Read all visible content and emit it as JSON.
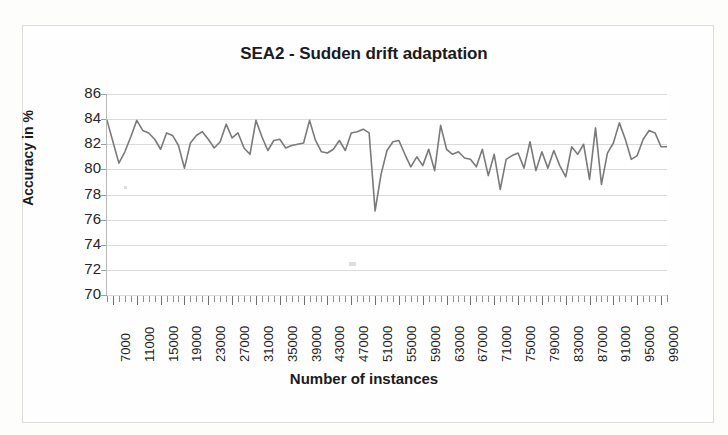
{
  "figure": {
    "title": "SEA2 - Sudden drift adaptation",
    "x_axis_title": "Number of instances",
    "y_axis_title": "Accuracy in %",
    "line_color": "#7a7a7a",
    "gridline_color": "#dadada",
    "background_color": "#fefefe"
  },
  "chart_data": {
    "type": "line",
    "title": "SEA2 - Sudden drift adaptation",
    "xlabel": "Number of instances",
    "ylabel": "Accuracy in %",
    "xlim": [
      6000,
      100000
    ],
    "ylim": [
      70,
      86
    ],
    "yticks": [
      70,
      72,
      74,
      76,
      78,
      80,
      82,
      84,
      86
    ],
    "xticks": [
      7000,
      11000,
      15000,
      19000,
      23000,
      27000,
      31000,
      35000,
      39000,
      43000,
      47000,
      51000,
      55000,
      59000,
      63000,
      67000,
      71000,
      75000,
      79000,
      83000,
      87000,
      91000,
      95000,
      99000
    ],
    "xtick_labels": [
      "7000",
      "11000",
      "15000",
      "19000",
      "23000",
      "27000",
      "31000",
      "35000",
      "39000",
      "43000",
      "47000",
      "51000",
      "55000",
      "59000",
      "63000",
      "67000",
      "71000",
      "75000",
      "79000",
      "83000",
      "87000",
      "91000",
      "95000",
      "99000"
    ],
    "grid": "horizontal",
    "legend": "none",
    "x_step": 1000,
    "series": [
      {
        "name": "Accuracy",
        "x": [
          6000,
          7000,
          8000,
          9000,
          10000,
          11000,
          12000,
          13000,
          14000,
          15000,
          16000,
          17000,
          18000,
          19000,
          20000,
          21000,
          22000,
          23000,
          24000,
          25000,
          26000,
          27000,
          28000,
          29000,
          30000,
          31000,
          32000,
          33000,
          34000,
          35000,
          36000,
          37000,
          38000,
          39000,
          40000,
          41000,
          42000,
          43000,
          44000,
          45000,
          46000,
          47000,
          48000,
          49000,
          50000,
          51000,
          52000,
          53000,
          54000,
          55000,
          56000,
          57000,
          58000,
          59000,
          60000,
          61000,
          62000,
          63000,
          64000,
          65000,
          66000,
          67000,
          68000,
          69000,
          70000,
          71000,
          72000,
          73000,
          74000,
          75000,
          76000,
          77000,
          78000,
          79000,
          80000,
          81000,
          82000,
          83000,
          84000,
          85000,
          86000,
          87000,
          88000,
          89000,
          90000,
          91000,
          92000,
          93000,
          94000,
          95000,
          96000,
          97000,
          98000,
          99000,
          100000
        ],
        "y": [
          83.9,
          82.2,
          80.5,
          81.4,
          82.6,
          83.9,
          83.1,
          82.9,
          82.4,
          81.6,
          82.9,
          82.7,
          81.9,
          80.1,
          82.1,
          82.7,
          83.0,
          82.4,
          81.7,
          82.2,
          83.6,
          82.5,
          82.9,
          81.7,
          81.2,
          83.9,
          82.6,
          81.5,
          82.3,
          82.4,
          81.7,
          81.9,
          82.0,
          82.1,
          83.9,
          82.3,
          81.4,
          81.3,
          81.6,
          82.3,
          81.5,
          82.9,
          83.0,
          83.2,
          82.9,
          76.7,
          79.6,
          81.5,
          82.2,
          82.3,
          81.2,
          80.2,
          81.0,
          80.3,
          81.6,
          79.9,
          83.5,
          81.6,
          81.2,
          81.4,
          80.9,
          80.8,
          80.2,
          81.6,
          79.5,
          81.2,
          78.4,
          80.8,
          81.1,
          81.3,
          80.1,
          82.2,
          79.9,
          81.4,
          80.1,
          81.5,
          80.3,
          79.4,
          81.8,
          81.2,
          82.0,
          79.2,
          83.3,
          78.8,
          81.3,
          82.1,
          83.7,
          82.4,
          80.8,
          81.1,
          82.4,
          83.1,
          82.9,
          81.8,
          81.8
        ]
      }
    ],
    "annotations": [
      {
        "label": "sudden drift drop",
        "x": 51000,
        "y": 76.7
      }
    ]
  }
}
